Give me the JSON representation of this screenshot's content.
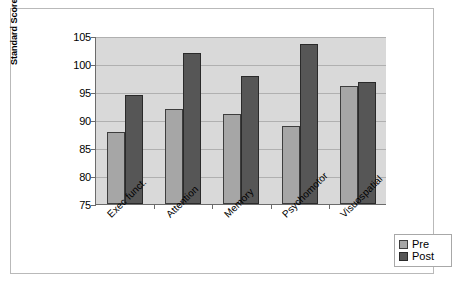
{
  "chart_data": {
    "type": "bar",
    "title": "",
    "xlabel": "",
    "ylabel": "Standard Score",
    "ylim": [
      75,
      105
    ],
    "ytick_step": 5,
    "yticks": [
      105,
      100,
      95,
      90,
      85,
      80,
      75
    ],
    "grid": true,
    "legend_position": "bottom-right",
    "categories": [
      "Exec funct.",
      "Attention",
      "Memory",
      "Psychomotor",
      "Visuospatial"
    ],
    "series": [
      {
        "name": "Pre",
        "color": "#a6a6a6",
        "values": [
          87.8,
          92.0,
          91.0,
          89.0,
          96.0
        ]
      },
      {
        "name": "Post",
        "color": "#565656",
        "values": [
          94.5,
          102.0,
          97.8,
          103.5,
          96.8
        ]
      }
    ]
  },
  "legend": {
    "items": [
      {
        "label": "Pre"
      },
      {
        "label": "Post"
      }
    ]
  },
  "colors": {
    "pre": "#a6a6a6",
    "post": "#565656",
    "plot_background": "#d9d9d9",
    "gridline": "#b0b0b0",
    "axis": "#6b6b6b",
    "page_border": "#b9b9b9"
  }
}
